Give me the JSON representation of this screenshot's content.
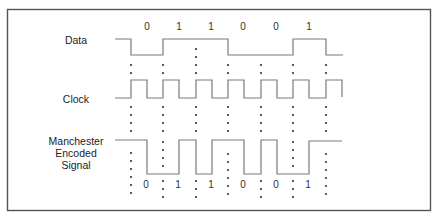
{
  "diagram": {
    "signals": {
      "data": {
        "label": "Data"
      },
      "clock": {
        "label": "Clock"
      },
      "manchester": {
        "label_lines": [
          "Manchester",
          "Encoded",
          "Signal"
        ]
      }
    },
    "bits_top": [
      "0",
      "1",
      "1",
      "0",
      "0",
      "1"
    ],
    "bits_bottom": [
      "0",
      "1",
      "1",
      "0",
      "0",
      "1"
    ],
    "colors": {
      "frame": "#555555",
      "waveform": "#7a7a7a",
      "dots": "#333333",
      "text": "#222222"
    }
  }
}
